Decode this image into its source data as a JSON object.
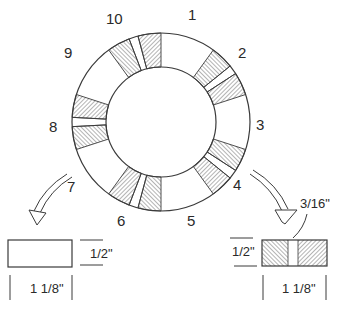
{
  "diagram": {
    "ring": {
      "segment_labels": [
        "1",
        "2",
        "3",
        "4",
        "5",
        "6",
        "7",
        "8",
        "9",
        "10"
      ],
      "stroke_color": "#3a3a3a"
    },
    "left_part": {
      "callout_from": "7",
      "height_label": "1/2\"",
      "width_label": "1 1/8\"",
      "fill": "plain"
    },
    "right_part": {
      "callout_from": "4",
      "height_label": "1/2\"",
      "width_label": "1 1/8\"",
      "gap_label": "3/16\"",
      "fill": "hatched with center gap"
    }
  }
}
